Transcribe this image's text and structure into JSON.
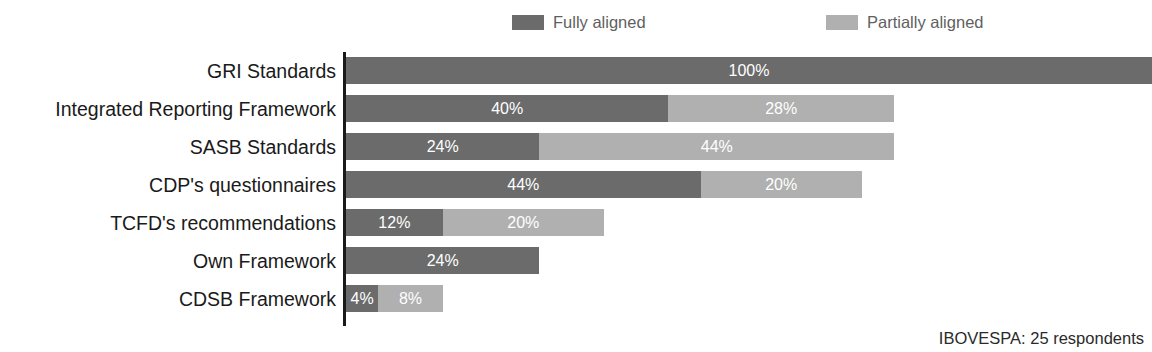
{
  "chart_data": {
    "type": "bar",
    "orientation": "horizontal",
    "stacked": true,
    "title": "",
    "xlabel": "",
    "ylabel": "",
    "xlim": [
      0,
      100
    ],
    "grid": false,
    "legend_position": "top",
    "axis_line": true,
    "value_suffix": "%",
    "categories": [
      "GRI Standards",
      "Integrated Reporting Framework",
      "SASB Standards",
      "CDP's questionnaires",
      "TCFD's recommendations",
      "Own Framework",
      "CDSB Framework"
    ],
    "series": [
      {
        "name": "Fully aligned",
        "color": "#6b6b6b",
        "values": [
          100,
          40,
          24,
          44,
          12,
          24,
          4
        ],
        "labels": [
          "100%",
          "40%",
          "24%",
          "44%",
          "12%",
          "24%",
          "4%"
        ]
      },
      {
        "name": "Partially aligned",
        "color": "#b0b0b0",
        "values": [
          0,
          28,
          44,
          20,
          20,
          0,
          8
        ],
        "labels": [
          "",
          "28%",
          "44%",
          "20%",
          "20%",
          "",
          "8%"
        ]
      }
    ],
    "annotations": [
      "IBOVESPA: 25 respondents"
    ]
  },
  "legend": {
    "items": [
      {
        "label": "Fully aligned",
        "color": "#6b6b6b"
      },
      {
        "label": "Partially aligned",
        "color": "#b0b0b0"
      }
    ]
  },
  "footnote": {
    "text": "IBOVESPA: 25 respondents"
  }
}
